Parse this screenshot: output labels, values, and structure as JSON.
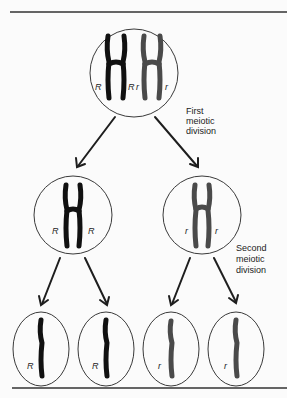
{
  "figure": {
    "colors": {
      "dominant_chromosome": "#111111",
      "recessive_chromosome": "#4a4a4a",
      "outline": "#3a3a3a",
      "background": "#fbfbfb"
    }
  },
  "stages": {
    "parent": {
      "alleles": [
        "R",
        "R",
        "r",
        "r"
      ]
    },
    "first_division": {
      "label_lines": [
        "First",
        "meiotic",
        "division"
      ]
    },
    "daughter_cells": [
      {
        "alleles": [
          "R",
          "R"
        ]
      },
      {
        "alleles": [
          "r",
          "r"
        ]
      }
    ],
    "second_division": {
      "label_lines": [
        "Second",
        "meiotic",
        "division"
      ]
    },
    "gametes": [
      {
        "allele": "R"
      },
      {
        "allele": "R"
      },
      {
        "allele": "r"
      },
      {
        "allele": "r"
      }
    ]
  }
}
